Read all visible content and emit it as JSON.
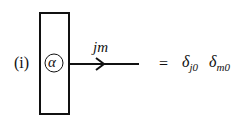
{
  "diagram": {
    "case_label": "(i)",
    "box_symbol": "α",
    "edge_label": "jm",
    "equals": "=",
    "rhs": [
      {
        "symbol": "δ",
        "subscript": "j0"
      },
      {
        "symbol": "δ",
        "subscript": "m0"
      }
    ],
    "colors": {
      "ink": "#111111",
      "background": "#ffffff"
    }
  }
}
